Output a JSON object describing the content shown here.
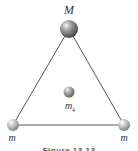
{
  "diagram": {
    "type": "equilateral-triangle-masses",
    "labels": {
      "top": "M",
      "center_base": "m",
      "center_sub": "4",
      "bottom_left": "m",
      "bottom_right": "m"
    },
    "caption": "Figure 13.13",
    "colors": {
      "line": "#555555",
      "sphere_top": "#8a8a8a",
      "sphere_small": "#b0b0b0",
      "label": "#333333"
    }
  }
}
